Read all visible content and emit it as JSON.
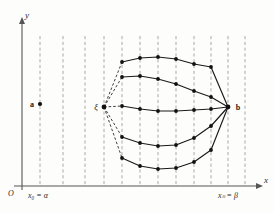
{
  "figure": {
    "background": "#fdfdfc",
    "width": 274,
    "height": 213,
    "colors": {
      "axis": "#555555",
      "gridline": "#9a9a9a",
      "curve": "#1a1a1a",
      "node": "#111111",
      "dashed_pencil": "#2a2a2a"
    }
  },
  "axes": {
    "x_axis_label": "x",
    "y_axis_label": "y",
    "origin_label": "O",
    "x_origin_px": 22,
    "y_origin_px": 186,
    "x_end_px": 262,
    "y_end_px": 16
  },
  "tick_labels": {
    "left": "x₀ = α",
    "right": "xₙ = β"
  },
  "point_labels": {
    "a": "a",
    "b": "b",
    "xi": "ξ"
  },
  "gridlines_x": [
    40,
    63,
    85,
    104,
    122,
    140,
    158,
    176,
    194,
    211,
    228,
    245
  ],
  "points": {
    "a": {
      "x": 40,
      "y": 104
    },
    "xi": {
      "x": 104,
      "y": 107
    },
    "b": {
      "x": 228,
      "y": 107
    }
  },
  "chart_data": {
    "type": "line",
    "xlabel": "x",
    "ylabel": "y",
    "grid": true,
    "legend": null,
    "x_nodes": [
      104,
      122,
      140,
      158,
      176,
      194,
      211,
      228
    ],
    "series": [
      {
        "name": "extremal-1-top",
        "style": "solid-with-dashed-lead",
        "dashed_lead": {
          "from": [
            104,
            107
          ],
          "to": [
            122,
            62
          ]
        },
        "values": [
          [
            122,
            62
          ],
          [
            140,
            58
          ],
          [
            158,
            57
          ],
          [
            176,
            59
          ],
          [
            194,
            64
          ],
          [
            211,
            67
          ],
          [
            228,
            107
          ]
        ]
      },
      {
        "name": "extremal-2-upper",
        "style": "solid-with-dashed-lead",
        "dashed_lead": {
          "from": [
            104,
            107
          ],
          "to": [
            122,
            77
          ]
        },
        "values": [
          [
            122,
            77
          ],
          [
            140,
            76
          ],
          [
            158,
            79
          ],
          [
            176,
            84
          ],
          [
            194,
            91
          ],
          [
            211,
            97
          ],
          [
            228,
            107
          ]
        ]
      },
      {
        "name": "extremal-3-middle",
        "style": "solid-with-dashed-lead",
        "dashed_lead": {
          "from": [
            104,
            107
          ],
          "to": [
            122,
            106
          ]
        },
        "values": [
          [
            122,
            106
          ],
          [
            140,
            109
          ],
          [
            158,
            111
          ],
          [
            176,
            111
          ],
          [
            194,
            110
          ],
          [
            211,
            109
          ],
          [
            228,
            107
          ]
        ]
      },
      {
        "name": "extremal-4-lower",
        "style": "solid-with-dashed-lead",
        "dashed_lead": {
          "from": [
            104,
            107
          ],
          "to": [
            122,
            137
          ]
        },
        "values": [
          [
            122,
            137
          ],
          [
            140,
            143
          ],
          [
            158,
            146
          ],
          [
            176,
            145
          ],
          [
            194,
            138
          ],
          [
            211,
            126
          ],
          [
            228,
            107
          ]
        ]
      },
      {
        "name": "extremal-5-bottom",
        "style": "solid-with-dashed-lead",
        "dashed_lead": {
          "from": [
            104,
            107
          ],
          "to": [
            122,
            158
          ]
        },
        "values": [
          [
            122,
            158
          ],
          [
            140,
            166
          ],
          [
            158,
            169
          ],
          [
            176,
            168
          ],
          [
            194,
            162
          ],
          [
            211,
            150
          ],
          [
            228,
            107
          ]
        ]
      }
    ],
    "node_marker": "filled-circle",
    "node_radius_px": 1.9
  }
}
